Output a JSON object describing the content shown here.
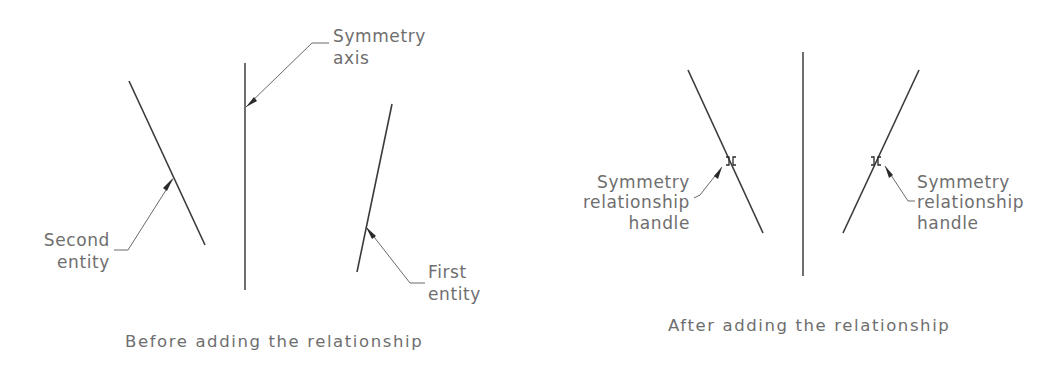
{
  "figure": {
    "before": {
      "caption": "Before adding the relationship",
      "labels": {
        "symmetry_axis": [
          "Symmetry",
          "axis"
        ],
        "second_entity": [
          "Second",
          "entity"
        ],
        "first_entity": [
          "First",
          "entity"
        ]
      }
    },
    "after": {
      "caption": "After adding the relationship",
      "labels": {
        "left_handle": [
          "Symmetry",
          "relationship",
          "handle"
        ],
        "right_handle": [
          "Symmetry",
          "relationship",
          "handle"
        ]
      }
    }
  },
  "colors": {
    "line": "#3a3a3a",
    "text": "#6e6e6e",
    "background": "#ffffff"
  }
}
